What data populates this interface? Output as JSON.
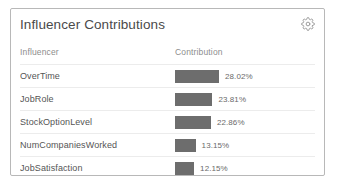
{
  "card": {
    "title": "Influencer Contributions",
    "settings_icon": "gear-icon"
  },
  "table": {
    "columns": [
      "Influencer",
      "Contribution"
    ],
    "rows": [
      {
        "influencer": "OverTime",
        "contribution_label": "28.02%",
        "contribution": 28.02
      },
      {
        "influencer": "JobRole",
        "contribution_label": "23.81%",
        "contribution": 23.81
      },
      {
        "influencer": "StockOptionLevel",
        "contribution_label": "22.86%",
        "contribution": 22.86
      },
      {
        "influencer": "NumCompaniesWorked",
        "contribution_label": "13.15%",
        "contribution": 13.15
      },
      {
        "influencer": "JobSatisfaction",
        "contribution_label": "12.15%",
        "contribution": 12.15
      }
    ]
  },
  "chart_data": {
    "type": "bar",
    "title": "Influencer Contributions",
    "xlabel": "Contribution",
    "ylabel": "Influencer",
    "orientation": "horizontal",
    "categories": [
      "OverTime",
      "JobRole",
      "StockOptionLevel",
      "NumCompaniesWorked",
      "JobSatisfaction"
    ],
    "values": [
      28.02,
      23.81,
      22.86,
      13.15,
      12.15
    ],
    "value_labels": [
      "28.02%",
      "23.81%",
      "22.86%",
      "13.15%",
      "12.15%"
    ],
    "unit": "%",
    "xlim": [
      0,
      30
    ],
    "grid": false,
    "legend": "none",
    "bar_color": "#6d6d6d"
  },
  "colors": {
    "bar": "#6d6d6d",
    "card_border": "#b8b8b8",
    "row_divider": "#ececec",
    "title_text": "#4a4a4a",
    "header_text": "#8d8d8d",
    "body_text": "#555555",
    "background": "#ffffff"
  }
}
